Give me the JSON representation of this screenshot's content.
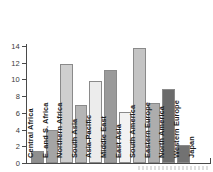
{
  "chart_data": {
    "type": "bar",
    "title": "",
    "subtitle": "",
    "xlabel": "",
    "ylabel": "",
    "categories": [
      "Central Africa",
      "E. and S. Africa",
      "Northern Africa",
      "South Asia",
      "Asia-Pacific",
      "Middle East",
      "East Asia",
      "South America",
      "Eastern Europe",
      "North America",
      "Western Europe",
      "Japan"
    ],
    "values": [
      1.4,
      3.9,
      11.9,
      6.9,
      9.8,
      11.1,
      6.1,
      13.8,
      7.2,
      8.8,
      2.1,
      0.0
    ],
    "bar_colors": [
      "#8f8f8f",
      "#a5a5a5",
      "#cfcfcf",
      "#b5b5b5",
      "#ececec",
      "#9a9a9a",
      "#f2f2f2",
      "#c4c4c4",
      "#adadad",
      "#6b6b6b",
      "#727272",
      "#e8e8e8"
    ],
    "ylim": [
      0,
      15
    ],
    "yticks": [
      0,
      2,
      4,
      6,
      8,
      10,
      12,
      14
    ],
    "ytick_labels": [
      "0",
      "2",
      "4",
      "6",
      "8",
      "10",
      "12",
      "14"
    ],
    "grid": false,
    "legend": false,
    "legend_position": "none",
    "label_orientation": "vertical",
    "axis_color": "#4a4a4a",
    "bar_border_color": "#8a8a8a",
    "text_color": "#1c1c1c",
    "background": "#ffffff"
  }
}
